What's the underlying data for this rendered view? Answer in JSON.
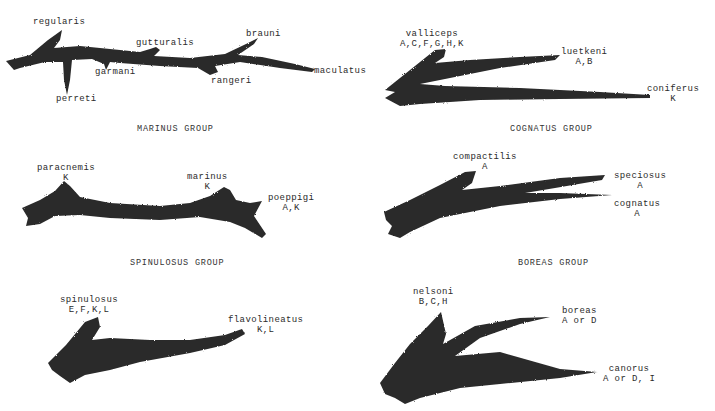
{
  "figure": {
    "ink_color": "#2a2a2a",
    "background": "#ffffff",
    "panels": [
      {
        "id": "marinus",
        "title": "MARINUS GROUP",
        "taxa": [
          {
            "name": "regularis",
            "regions": ""
          },
          {
            "name": "gutturalis",
            "regions": ""
          },
          {
            "name": "brauni",
            "regions": ""
          },
          {
            "name": "garmani",
            "regions": ""
          },
          {
            "name": "rangeri",
            "regions": ""
          },
          {
            "name": "maculatus",
            "regions": ""
          },
          {
            "name": "perreti",
            "regions": ""
          }
        ]
      },
      {
        "id": "cognatus",
        "title": "COGNATUS GROUP",
        "taxa": [
          {
            "name": "valliceps",
            "regions": "A,C,F,G,H,K"
          },
          {
            "name": "luetkeni",
            "regions": "A,B"
          },
          {
            "name": "coniferus",
            "regions": "K"
          }
        ]
      },
      {
        "id": "spinulosus",
        "title": "SPINULOSUS GROUP",
        "taxa": [
          {
            "name": "paracnemis",
            "regions": "K"
          },
          {
            "name": "marinus",
            "regions": "K"
          },
          {
            "name": "poeppigi",
            "regions": "A,K"
          }
        ]
      },
      {
        "id": "boreas",
        "title": "BOREAS GROUP",
        "taxa": [
          {
            "name": "compactilis",
            "regions": "A"
          },
          {
            "name": "speciosus",
            "regions": "A"
          },
          {
            "name": "cognatus",
            "regions": "A"
          }
        ]
      },
      {
        "id": "spinulosus-lower",
        "title": "",
        "taxa": [
          {
            "name": "spinulosus",
            "regions": "E,F,K,L"
          },
          {
            "name": "flavolineatus",
            "regions": "K,L"
          }
        ]
      },
      {
        "id": "boreas-lower",
        "title": "",
        "taxa": [
          {
            "name": "nelsoni",
            "regions": "B,C,H"
          },
          {
            "name": "boreas",
            "regions": "A or D"
          },
          {
            "name": "canorus",
            "regions": "A or D, I"
          }
        ]
      }
    ]
  }
}
